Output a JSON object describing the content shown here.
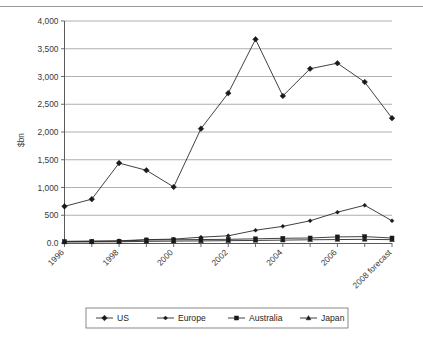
{
  "chart_data": {
    "type": "line",
    "title": "",
    "xlabel": "",
    "ylabel": "$bn",
    "ylim": [
      0,
      4000
    ],
    "ytick_labels": [
      "0.0",
      "500",
      "1,000",
      "1,500",
      "2,000",
      "2,500",
      "3,000",
      "3,500",
      "4,000"
    ],
    "ytick_values": [
      0,
      500,
      1000,
      1500,
      2000,
      2500,
      3000,
      3500,
      4000
    ],
    "grid": true,
    "legend_position": "bottom",
    "x": [
      1996,
      1997,
      1998,
      1999,
      2000,
      2001,
      2002,
      2003,
      2004,
      2005,
      2006,
      2007,
      2008
    ],
    "categories": [
      "1996",
      "1997",
      "1998",
      "1999",
      "2000",
      "2001",
      "2002",
      "2003",
      "2004",
      "2005",
      "2006",
      "2007",
      "2008 forecast"
    ],
    "xtick_labels_shown": [
      "1996",
      "1998",
      "2000",
      "2002",
      "2004",
      "2006",
      "2008 forecast"
    ],
    "series": [
      {
        "name": "US",
        "marker": "diamond",
        "values": [
          660,
          790,
          1440,
          1310,
          1010,
          2060,
          2700,
          3670,
          2650,
          3140,
          3240,
          2900,
          2250
        ]
      },
      {
        "name": "Europe",
        "marker": "diamond-small",
        "values": [
          30,
          35,
          40,
          60,
          70,
          105,
          130,
          230,
          300,
          400,
          555,
          680,
          400
        ]
      },
      {
        "name": "Australia",
        "marker": "square",
        "values": [
          25,
          28,
          32,
          55,
          58,
          62,
          66,
          75,
          85,
          90,
          110,
          115,
          90
        ]
      },
      {
        "name": "Japan",
        "marker": "triangle",
        "values": [
          18,
          20,
          22,
          30,
          34,
          38,
          42,
          46,
          52,
          58,
          62,
          66,
          60
        ]
      }
    ]
  },
  "legend": {
    "items": [
      {
        "label": "US"
      },
      {
        "label": "Europe"
      },
      {
        "label": "Australia"
      },
      {
        "label": "Japan"
      }
    ]
  }
}
